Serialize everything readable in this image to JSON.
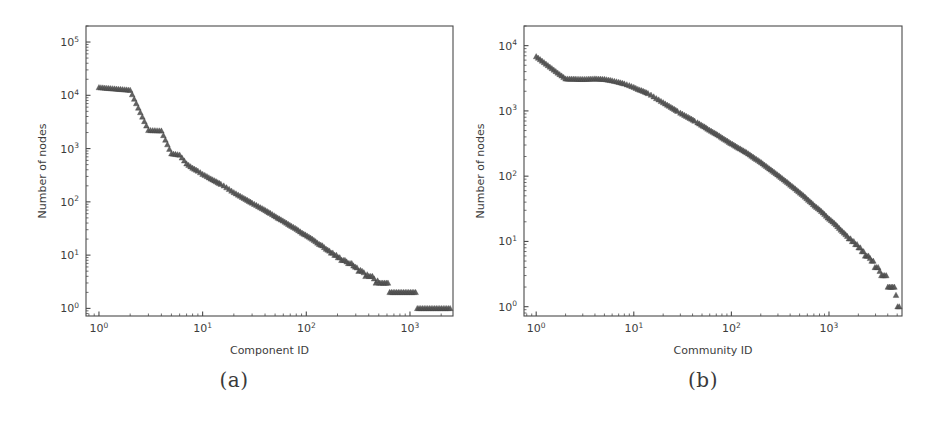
{
  "figure": {
    "background_color": "#ffffff",
    "marker_color": "#555555",
    "axis_color": "#4a4a4a",
    "panels": [
      {
        "caption": "(a)"
      },
      {
        "caption": "(b)"
      }
    ]
  },
  "chart_data": [
    {
      "type": "scatter",
      "panel": "(a)",
      "title": "",
      "xlabel": "Component ID",
      "ylabel": "Number of nodes",
      "xscale": "log",
      "yscale": "log",
      "xlim": [
        0.75,
        2600
      ],
      "ylim": [
        0.72,
        200000
      ],
      "xticks": [
        "10^0",
        "10^1",
        "10^2",
        "10^3"
      ],
      "xtick_values": [
        1,
        10,
        100,
        1000
      ],
      "yticks": [
        "10^0",
        "10^1",
        "10^2",
        "10^3",
        "10^4",
        "10^5"
      ],
      "ytick_values": [
        1,
        10,
        100,
        1000,
        10000,
        100000
      ],
      "grid": false,
      "legend": null,
      "marker": "triangle",
      "x": [
        1,
        2,
        3,
        4,
        5,
        6,
        7,
        8,
        9,
        10,
        11,
        12,
        13,
        14,
        15,
        16,
        17,
        18,
        19,
        20,
        22,
        24,
        26,
        28,
        30,
        33,
        36,
        39,
        42,
        45,
        49,
        53,
        57,
        62,
        67,
        72,
        78,
        84,
        91,
        98,
        106,
        114,
        123,
        133,
        143,
        155,
        167,
        180,
        195,
        210,
        227,
        245,
        264,
        285,
        308,
        332,
        359,
        387,
        418,
        451,
        487,
        526,
        568,
        613,
        662,
        715,
        772,
        833,
        900,
        972,
        1049,
        1133,
        1223,
        1321,
        1426,
        1540,
        1663,
        1796,
        1939,
        2094,
        2261,
        2440
      ],
      "y": [
        14000,
        12500,
        2200,
        2150,
        800,
        760,
        520,
        430,
        380,
        330,
        300,
        270,
        250,
        230,
        215,
        200,
        185,
        172,
        160,
        150,
        135,
        122,
        112,
        103,
        95,
        86,
        78,
        72,
        66,
        61,
        55,
        50,
        46,
        42,
        38,
        35,
        32,
        29,
        26,
        24,
        22,
        20,
        18,
        16,
        15,
        13,
        12,
        11,
        10,
        9,
        8,
        7.5,
        7,
        6.3,
        5.8,
        5.2,
        4.7,
        4.3,
        4,
        3.6,
        3.3,
        3,
        3,
        3,
        2,
        2,
        2,
        2,
        2,
        2,
        2,
        2,
        1,
        1,
        1,
        1,
        1,
        1,
        1,
        1,
        1,
        1,
        1,
        1
      ]
    },
    {
      "type": "scatter",
      "panel": "(b)",
      "title": "",
      "xlabel": "Community ID",
      "ylabel": "Number of nodes",
      "xscale": "log",
      "yscale": "log",
      "xlim": [
        0.75,
        5600
      ],
      "ylim": [
        0.72,
        20000
      ],
      "xticks": [
        "10^0",
        "10^1",
        "10^2",
        "10^3"
      ],
      "xtick_values": [
        1,
        10,
        100,
        1000
      ],
      "yticks": [
        "10^0",
        "10^1",
        "10^2",
        "10^3",
        "10^4"
      ],
      "ytick_values": [
        1,
        10,
        100,
        1000,
        10000
      ],
      "grid": false,
      "legend": null,
      "marker": "triangle",
      "x": [
        1,
        2,
        3,
        4,
        5,
        6,
        7,
        8,
        9,
        10,
        11,
        12,
        13,
        14,
        15,
        16,
        17,
        18,
        19,
        20,
        22,
        24,
        26,
        28,
        30,
        33,
        36,
        39,
        42,
        45,
        49,
        53,
        57,
        62,
        67,
        72,
        78,
        84,
        91,
        98,
        106,
        114,
        123,
        133,
        143,
        155,
        167,
        180,
        195,
        210,
        227,
        245,
        264,
        285,
        308,
        332,
        359,
        387,
        418,
        451,
        487,
        526,
        568,
        613,
        662,
        715,
        772,
        833,
        900,
        972,
        1049,
        1133,
        1223,
        1321,
        1426,
        1540,
        1663,
        1796,
        1939,
        2094,
        2261,
        2440,
        2634,
        2843,
        3070,
        3314,
        3578,
        3863,
        4171,
        4503,
        4861,
        5248
      ],
      "y": [
        6800,
        3100,
        3050,
        3100,
        3050,
        2900,
        2750,
        2600,
        2450,
        2300,
        2150,
        2050,
        1950,
        1850,
        1750,
        1650,
        1550,
        1480,
        1400,
        1340,
        1230,
        1140,
        1060,
        990,
        930,
        860,
        800,
        750,
        700,
        660,
        610,
        570,
        530,
        490,
        460,
        430,
        400,
        370,
        345,
        320,
        300,
        280,
        262,
        245,
        230,
        212,
        196,
        182,
        168,
        155,
        142,
        130,
        120,
        110,
        101,
        92,
        84,
        77,
        70,
        64,
        58,
        53,
        48,
        43,
        39,
        35,
        32,
        29,
        26,
        23,
        21,
        19,
        17,
        15,
        13.5,
        12,
        11,
        10,
        9,
        8,
        7,
        6,
        5.5,
        5,
        4,
        3.5,
        3,
        3,
        2,
        2,
        1.5,
        1,
        1,
        1
      ]
    }
  ]
}
